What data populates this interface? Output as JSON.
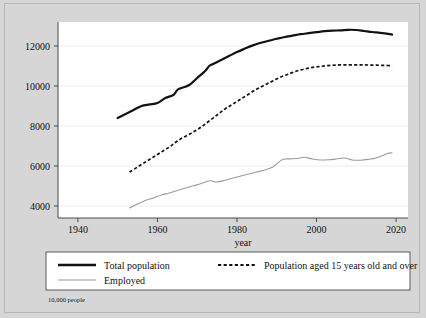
{
  "chart_data": {
    "type": "line",
    "title": "",
    "xlabel": "year",
    "ylabel": "",
    "unit_note": "10,000 people",
    "xlim": [
      1935,
      2023
    ],
    "ylim": [
      3400,
      13200
    ],
    "xticks": [
      1940,
      1960,
      1980,
      2000,
      2020
    ],
    "xtick_labels": [
      "1940",
      "1960",
      "1980",
      "2000",
      "2020"
    ],
    "yticks": [
      4000,
      6000,
      8000,
      10000,
      12000
    ],
    "ytick_labels": [
      "4000",
      "6000",
      "8000",
      "10000",
      "12000"
    ],
    "grid": "horizontal",
    "legend_position": "below-axes",
    "series": [
      {
        "name": "Total population",
        "style": "solid-thick-black",
        "color": "#121212",
        "x": [
          1950,
          1952,
          1954,
          1956,
          1958,
          1960,
          1962,
          1964,
          1965,
          1966,
          1968,
          1970,
          1972,
          1973,
          1974,
          1976,
          1978,
          1980,
          1982,
          1984,
          1986,
          1988,
          1990,
          1992,
          1994,
          1996,
          1998,
          2000,
          2002,
          2004,
          2006,
          2008,
          2010,
          2012,
          2014,
          2016,
          2018,
          2019
        ],
        "values": [
          8400,
          8600,
          8800,
          9000,
          9080,
          9150,
          9400,
          9550,
          9800,
          9900,
          10050,
          10400,
          10750,
          11000,
          11100,
          11300,
          11500,
          11700,
          11870,
          12030,
          12160,
          12260,
          12360,
          12450,
          12520,
          12590,
          12640,
          12690,
          12740,
          12770,
          12780,
          12810,
          12800,
          12750,
          12700,
          12660,
          12610,
          12570
        ]
      },
      {
        "name": "Population aged 15 years old and over",
        "style": "dashed-black",
        "color": "#121212",
        "x": [
          1953,
          1955,
          1957,
          1959,
          1961,
          1963,
          1965,
          1967,
          1969,
          1971,
          1973,
          1975,
          1977,
          1979,
          1981,
          1983,
          1985,
          1987,
          1989,
          1991,
          1993,
          1995,
          1997,
          1999,
          2001,
          2003,
          2005,
          2007,
          2009,
          2011,
          2013,
          2015,
          2017,
          2019
        ],
        "values": [
          5700,
          5950,
          6200,
          6450,
          6700,
          6950,
          7250,
          7480,
          7700,
          7950,
          8250,
          8550,
          8850,
          9100,
          9350,
          9600,
          9850,
          10050,
          10250,
          10450,
          10600,
          10750,
          10850,
          10930,
          10980,
          11020,
          11050,
          11060,
          11060,
          11060,
          11050,
          11040,
          11030,
          11020
        ]
      },
      {
        "name": "Employed",
        "style": "solid-thin-gray",
        "color": "#9a9a9a",
        "x": [
          1953,
          1955,
          1957,
          1959,
          1961,
          1963,
          1965,
          1967,
          1969,
          1971,
          1973,
          1974,
          1975,
          1977,
          1979,
          1981,
          1983,
          1985,
          1987,
          1989,
          1991,
          1992,
          1994,
          1996,
          1997,
          1999,
          2001,
          2003,
          2005,
          2007,
          2009,
          2011,
          2013,
          2015,
          2017,
          2018,
          2019
        ],
        "values": [
          3900,
          4100,
          4280,
          4400,
          4550,
          4650,
          4780,
          4900,
          5010,
          5120,
          5260,
          5230,
          5200,
          5290,
          5400,
          5500,
          5600,
          5700,
          5800,
          5950,
          6270,
          6350,
          6360,
          6400,
          6440,
          6350,
          6300,
          6310,
          6350,
          6400,
          6300,
          6290,
          6330,
          6400,
          6550,
          6640,
          6660
        ]
      }
    ],
    "legend_entries": [
      {
        "label": "Total population",
        "style": "solid-thick-black"
      },
      {
        "label": "Population aged 15 years old and over",
        "style": "dashed-black"
      },
      {
        "label": "Employed",
        "style": "solid-thin-gray"
      }
    ],
    "colors": {
      "background": "#d6d6d6",
      "plot_area": "#ffffff",
      "gridline": "#e9e9e9",
      "axis": "#4a4a4a",
      "total_population": "#121212",
      "over15": "#121212",
      "employed": "#9a9a9a"
    }
  }
}
